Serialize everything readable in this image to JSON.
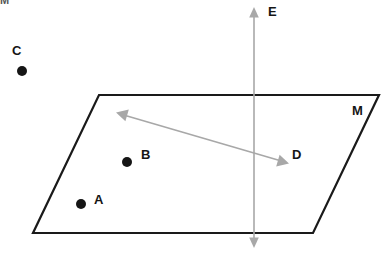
{
  "figure": {
    "background_color": "#ffffff",
    "width": 386,
    "height": 253,
    "top_artifact": "M"
  },
  "plane": {
    "name": "M",
    "label": "M",
    "label_x": 352,
    "label_y": 112,
    "stroke_color": "#1a1a1a",
    "stroke_width": 2.2,
    "fill": "none",
    "vertices": [
      {
        "id": "top-left",
        "x": 99,
        "y": 95
      },
      {
        "id": "top-right",
        "x": 379,
        "y": 95
      },
      {
        "id": "bottom-right",
        "x": 313,
        "y": 233
      },
      {
        "id": "bottom-left",
        "x": 33,
        "y": 233
      }
    ]
  },
  "points": [
    {
      "label": "A",
      "dot_x": 81,
      "dot_y": 204,
      "label_x": 94,
      "label_y": 201,
      "radius": 5,
      "color": "#151515",
      "in_plane": true
    },
    {
      "label": "B",
      "dot_x": 127,
      "dot_y": 162,
      "label_x": 141,
      "label_y": 156,
      "radius": 5,
      "color": "#151515",
      "in_plane": true
    },
    {
      "label": "C",
      "dot_x": 22,
      "dot_y": 71,
      "label_x": 12,
      "label_y": 52,
      "radius": 5,
      "color": "#151515",
      "in_plane": false
    }
  ],
  "lines": [
    {
      "label": "D",
      "label_x": 292,
      "label_y": 156,
      "color": "#a8a8a8",
      "stroke_width": 1.6,
      "arrow": "double",
      "x1": 117,
      "y1": 113,
      "x2": 288,
      "y2": 163,
      "orientation": "diagonal-in-plane"
    },
    {
      "label": "E",
      "label_x": 268,
      "label_y": 13,
      "color": "#a8a8a8",
      "stroke_width": 1.6,
      "arrow": "double",
      "x1": 254,
      "y1": 8,
      "x2": 254,
      "y2": 247,
      "orientation": "vertical-through-plane"
    }
  ]
}
